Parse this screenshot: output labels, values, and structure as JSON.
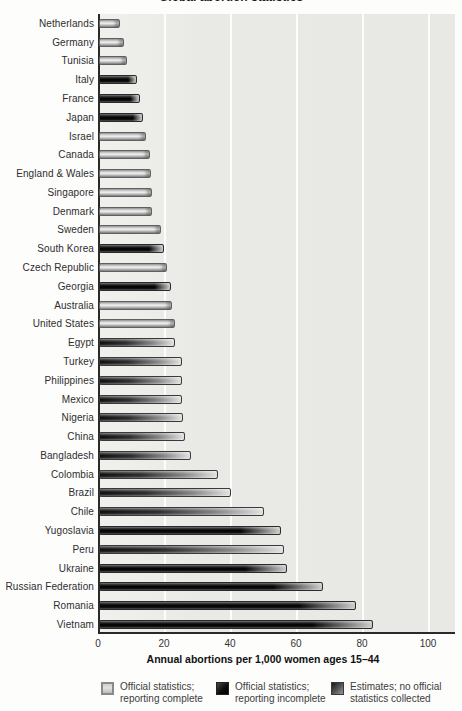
{
  "title": "Global abortion statistics",
  "chart_data": {
    "type": "bar",
    "orientation": "horizontal",
    "title": "Global abortion statistics",
    "xlabel": "Annual abortions per 1,000 women ages 15–44",
    "xlim": [
      0,
      108
    ],
    "xticks": [
      0,
      20,
      40,
      60,
      80,
      100
    ],
    "grid": "vertical white gridlines at each tick",
    "legend_position": "bottom",
    "rows": [
      {
        "label": "Netherlands",
        "value": 6.5,
        "status": "complete"
      },
      {
        "label": "Germany",
        "value": 7.6,
        "status": "complete"
      },
      {
        "label": "Tunisia",
        "value": 8.6,
        "status": "complete"
      },
      {
        "label": "Italy",
        "value": 11.4,
        "status": "incomplete"
      },
      {
        "label": "France",
        "value": 12.4,
        "status": "incomplete"
      },
      {
        "label": "Japan",
        "value": 13.4,
        "status": "incomplete"
      },
      {
        "label": "Israel",
        "value": 14.3,
        "status": "complete"
      },
      {
        "label": "Canada",
        "value": 15.5,
        "status": "complete"
      },
      {
        "label": "England & Wales",
        "value": 15.6,
        "status": "complete"
      },
      {
        "label": "Singapore",
        "value": 15.9,
        "status": "complete"
      },
      {
        "label": "Denmark",
        "value": 16.1,
        "status": "complete"
      },
      {
        "label": "Sweden",
        "value": 18.7,
        "status": "complete"
      },
      {
        "label": "South Korea",
        "value": 19.6,
        "status": "incomplete"
      },
      {
        "label": "Czech Republic",
        "value": 20.7,
        "status": "complete"
      },
      {
        "label": "Georgia",
        "value": 21.9,
        "status": "incomplete"
      },
      {
        "label": "Australia",
        "value": 22.2,
        "status": "complete"
      },
      {
        "label": "United States",
        "value": 22.9,
        "status": "complete"
      },
      {
        "label": "Egypt",
        "value": 23,
        "status": "estimate"
      },
      {
        "label": "Turkey",
        "value": 25,
        "status": "estimate"
      },
      {
        "label": "Philippines",
        "value": 25,
        "status": "estimate"
      },
      {
        "label": "Mexico",
        "value": 25,
        "status": "estimate"
      },
      {
        "label": "Nigeria",
        "value": 25.5,
        "status": "estimate"
      },
      {
        "label": "China",
        "value": 26,
        "status": "estimate"
      },
      {
        "label": "Bangladesh",
        "value": 28,
        "status": "estimate"
      },
      {
        "label": "Colombia",
        "value": 36,
        "status": "estimate"
      },
      {
        "label": "Brazil",
        "value": 40,
        "status": "estimate"
      },
      {
        "label": "Chile",
        "value": 50,
        "status": "estimate"
      },
      {
        "label": "Yugoslavia",
        "value": 55,
        "status": "incomplete"
      },
      {
        "label": "Peru",
        "value": 56,
        "status": "estimate"
      },
      {
        "label": "Ukraine",
        "value": 57,
        "status": "incomplete"
      },
      {
        "label": "Russian Federation",
        "value": 68,
        "status": "incomplete"
      },
      {
        "label": "Romania",
        "value": 78,
        "status": "incomplete"
      },
      {
        "label": "Vietnam",
        "value": 83,
        "status": "incomplete"
      }
    ]
  },
  "legend": {
    "items": [
      {
        "line1": "Official statistics;",
        "line2": "reporting complete",
        "status": "complete",
        "swatch_color": "#cccccc"
      },
      {
        "line1": "Official statistics;",
        "line2": "reporting incomplete",
        "status": "incomplete",
        "swatch_color": "#141414"
      },
      {
        "line1": "Estimates; no official",
        "line2": "statistics collected",
        "status": "estimate",
        "swatch_color": "#4d4d4d"
      }
    ]
  },
  "colors": {
    "plot_background": "#e8e8e4",
    "gridline": "#ffffff",
    "axis": "#2a2a2a",
    "bar_complete": "#cccccc",
    "bar_incomplete": "#141414",
    "bar_estimate": "#4d4d4d",
    "label_text": "#2e2e2e"
  }
}
